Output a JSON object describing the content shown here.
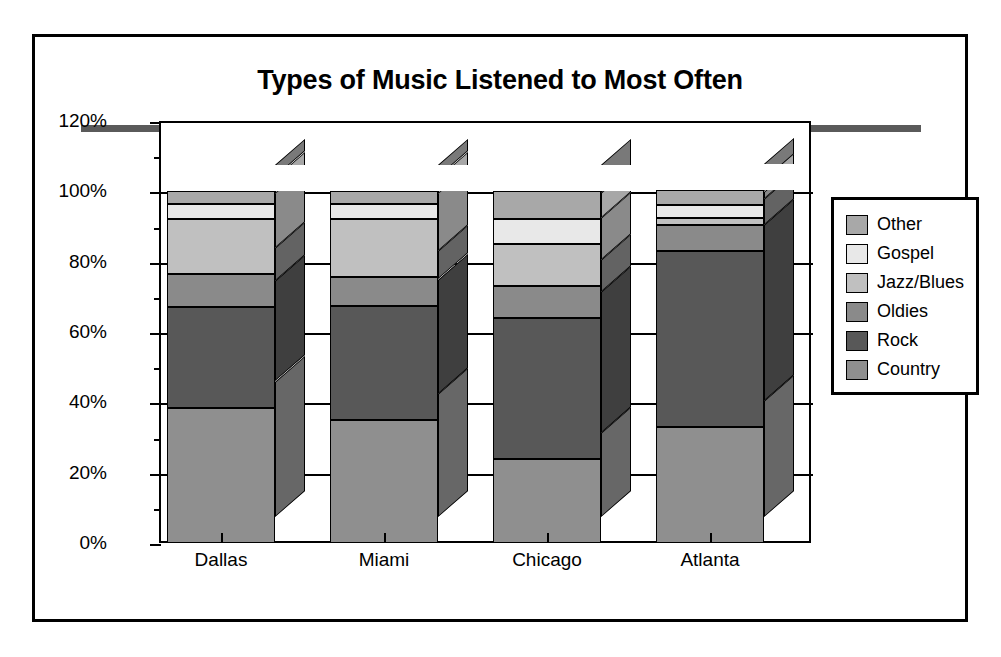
{
  "chart_data": {
    "type": "bar",
    "subtype": "stacked-column-3d",
    "title": "Types of Music Listened to Most Often",
    "xlabel": "",
    "ylabel": "",
    "categories": [
      "Dallas",
      "Miami",
      "Chicago",
      "Atlanta"
    ],
    "ylim": [
      0,
      120
    ],
    "ytick_labels": [
      "0%",
      "20%",
      "40%",
      "60%",
      "80%",
      "100%",
      "120%"
    ],
    "ytick_values": [
      0,
      20,
      40,
      60,
      80,
      100,
      120
    ],
    "minor_tick_interval": 10,
    "grid": false,
    "legend_position": "right",
    "stack_order_bottom_to_top": [
      "Country",
      "Rock",
      "Oldies",
      "Jazz/Blues",
      "Gospel",
      "Other"
    ],
    "series": [
      {
        "name": "Other",
        "color": "#a8a8a8",
        "values": [
          3.5,
          3.5,
          8.0,
          4.5
        ]
      },
      {
        "name": "Gospel",
        "color": "#e8e8e8",
        "values": [
          4.5,
          4.5,
          7.0,
          3.5
        ]
      },
      {
        "name": "Jazz/Blues",
        "color": "#c0c0c0",
        "values": [
          15.5,
          16.5,
          12.0,
          2.0
        ]
      },
      {
        "name": "Oldies",
        "color": "#8a8a8a",
        "values": [
          9.5,
          8.0,
          9.0,
          7.5
        ]
      },
      {
        "name": "Rock",
        "color": "#585858",
        "values": [
          28.5,
          32.5,
          40.0,
          50.0
        ]
      },
      {
        "name": "Country",
        "color": "#8f8f8f",
        "values": [
          38.5,
          35.0,
          24.0,
          33.0
        ]
      }
    ],
    "cumulative_tops_percent": {
      "Dallas": {
        "Country": 38.5,
        "Rock": 67.0,
        "Oldies": 76.5,
        "Jazz/Blues": 92.0,
        "Gospel": 96.5,
        "Other": 100
      },
      "Miami": {
        "Country": 35.0,
        "Rock": 67.5,
        "Oldies": 75.5,
        "Jazz/Blues": 92.0,
        "Gospel": 96.5,
        "Other": 100
      },
      "Chicago": {
        "Country": 24.0,
        "Rock": 64.0,
        "Oldies": 73.0,
        "Jazz/Blues": 85.0,
        "Gospel": 92.0,
        "Other": 100
      },
      "Atlanta": {
        "Country": 33.0,
        "Rock": 83.0,
        "Oldies": 90.5,
        "Jazz/Blues": 92.5,
        "Gospel": 96.0,
        "Other": 100
      }
    }
  },
  "legend": {
    "items": [
      {
        "label": "Other"
      },
      {
        "label": "Gospel"
      },
      {
        "label": "Jazz/Blues"
      },
      {
        "label": "Oldies"
      },
      {
        "label": "Rock"
      },
      {
        "label": "Country"
      }
    ]
  },
  "colors": {
    "other": "#a8a8a8",
    "gospel": "#e8e8e8",
    "jazz_blues": "#c0c0c0",
    "oldies": "#8a8a8a",
    "rock": "#585858",
    "country": "#8f8f8f",
    "rule": "#5a5a5a",
    "axis": "#000000"
  }
}
